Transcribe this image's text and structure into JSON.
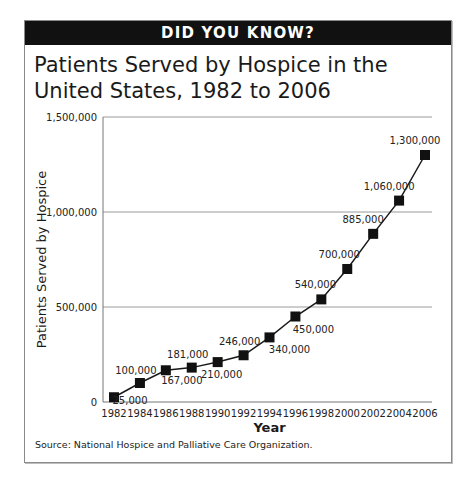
{
  "banner": {
    "text": "DID YOU KNOW?"
  },
  "title": {
    "line1": "Patients Served by Hospice in the",
    "line2": "United States, 1982 to 2006"
  },
  "source": "Source: National Hospice and Palliative Care Organization.",
  "chart_data": {
    "type": "line",
    "title": "Patients Served by Hospice in the United States, 1982 to 2006",
    "xlabel": "Year",
    "ylabel": "Patients Served by Hospice",
    "x": [
      "1982",
      "1984",
      "1986",
      "1988",
      "1990",
      "1992",
      "1994",
      "1996",
      "1998",
      "2000",
      "2002",
      "2004",
      "2006"
    ],
    "series": [
      {
        "name": "Patients Served by Hospice",
        "values": [
          25000,
          100000,
          167000,
          181000,
          210000,
          246000,
          340000,
          450000,
          540000,
          700000,
          885000,
          1060000,
          1300000
        ]
      }
    ],
    "data_labels": [
      "25,000",
      "100,000",
      "167,000",
      "181,000",
      "210,000",
      "246,000",
      "340,000",
      "450,000",
      "540,000",
      "700,000",
      "885,000",
      "1,060,000",
      "1,300,000"
    ],
    "yticks": [
      0,
      500000,
      1000000,
      1500000
    ],
    "ytick_labels": [
      "0",
      "500,000",
      "1,000,000",
      "1,500,000"
    ],
    "ylim": [
      0,
      1500000
    ],
    "grid": "horizontal at 500,000 and 1,000,000",
    "legend": "none",
    "marker": "square",
    "colors": {
      "line": "#1a1a1a",
      "marker": "#111111",
      "grid": "#9a9a9a"
    }
  }
}
